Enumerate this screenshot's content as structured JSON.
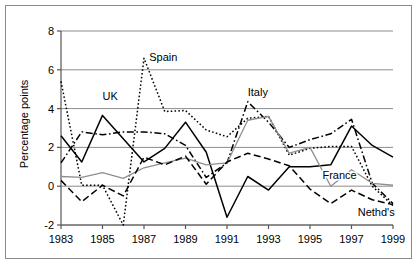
{
  "chart_data": {
    "type": "line",
    "title": "",
    "xlabel": "",
    "ylabel": "Percentage points",
    "xlim": [
      1983,
      1999
    ],
    "ylim": [
      -2,
      8
    ],
    "xticks": [
      1983,
      1985,
      1987,
      1989,
      1991,
      1993,
      1995,
      1997,
      1999
    ],
    "xtick_labels": [
      "1983",
      "1985",
      "1987",
      "1989",
      "1991",
      "1993",
      "1995",
      "1997",
      "1999"
    ],
    "yticks": [
      -2,
      0,
      2,
      4,
      6,
      8
    ],
    "ytick_labels": [
      "-2",
      "0",
      "2",
      "4",
      "6",
      "8"
    ],
    "grid": "horizontal",
    "legend_position": "inline-annotations",
    "x": [
      1983,
      1984,
      1985,
      1986,
      1987,
      1988,
      1989,
      1990,
      1991,
      1992,
      1993,
      1994,
      1995,
      1996,
      1997,
      1998,
      1999
    ],
    "series": [
      {
        "name": "UK",
        "style": "solid",
        "color": "#000000",
        "label_x": 1985.0,
        "label_y": 4.45,
        "values": [
          2.6,
          1.25,
          3.65,
          2.45,
          1.25,
          1.95,
          3.3,
          1.75,
          -1.6,
          0.5,
          -0.2,
          1.0,
          1.0,
          1.1,
          3.1,
          2.1,
          1.5
        ]
      },
      {
        "name": "Spain",
        "style": "dotted",
        "color": "#000000",
        "label_x": 1987.25,
        "label_y": 6.45,
        "values": [
          5.4,
          0.05,
          0.05,
          -2.0,
          6.6,
          3.85,
          3.9,
          2.9,
          2.55,
          3.5,
          3.6,
          1.6,
          1.95,
          2.05,
          2.05,
          0.0,
          -1.0
        ]
      },
      {
        "name": "Italy",
        "style": "dashdot",
        "color": "#000000",
        "label_x": 1992.0,
        "label_y": 4.65,
        "values": [
          1.2,
          2.8,
          2.65,
          2.8,
          2.8,
          2.7,
          2.1,
          0.45,
          1.2,
          4.35,
          3.3,
          2.0,
          2.4,
          2.7,
          3.45,
          0.15,
          -0.9
        ]
      },
      {
        "name": "France",
        "style": "solid",
        "color": "#8f8f8f",
        "label_x": 1995.6,
        "label_y": 0.35,
        "values": [
          0.5,
          0.45,
          0.7,
          0.4,
          0.95,
          1.2,
          1.45,
          1.1,
          1.2,
          3.4,
          3.6,
          1.7,
          2.0,
          0.0,
          0.85,
          0.15,
          0.05
        ]
      },
      {
        "name": "Nethd's",
        "style": "dashed",
        "color": "#000000",
        "label_x": 1997.3,
        "label_y": -1.55,
        "values": [
          0.3,
          -0.8,
          0.05,
          -0.5,
          1.5,
          1.1,
          1.55,
          0.1,
          1.25,
          1.7,
          1.4,
          1.05,
          -0.15,
          -0.9,
          -0.2,
          -0.7,
          -0.95
        ]
      }
    ]
  }
}
